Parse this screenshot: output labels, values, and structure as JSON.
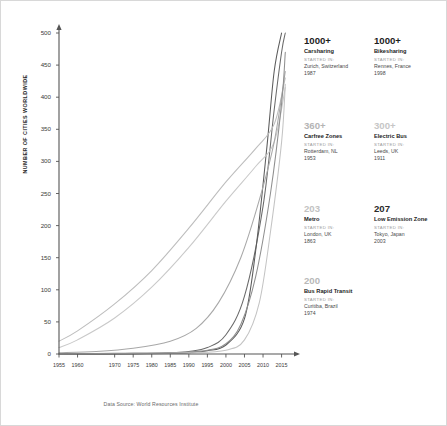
{
  "chart_data": {
    "type": "line",
    "title": "",
    "xlabel": "",
    "ylabel": "NUMBER OF CITIES WORLDWIDE",
    "xlim": [
      1955,
      2017
    ],
    "ylim": [
      0,
      500
    ],
    "grid": false,
    "legend_position": "right-panel",
    "x_tick_labels": [
      "1955",
      "1960",
      "1970",
      "1975",
      "1980",
      "1985",
      "1990",
      "1995",
      "2000",
      "2005",
      "2010",
      "2015"
    ],
    "x_ticks": [
      1955,
      1960,
      1970,
      1975,
      1980,
      1985,
      1990,
      1995,
      2000,
      2005,
      2010,
      2015
    ],
    "y_tick_labels": [
      "0",
      "50",
      "100",
      "150",
      "200",
      "250",
      "300",
      "350",
      "400",
      "450",
      "500"
    ],
    "y_ticks": [
      0,
      50,
      100,
      150,
      200,
      250,
      300,
      350,
      400,
      450,
      500
    ],
    "annotation": "Data Source: World Resources Institute",
    "series": [
      {
        "name": "Carsharing",
        "color": "#6a6a6a",
        "x": [
          1955,
          1965,
          1975,
          1985,
          1990,
          1995,
          2000,
          2005,
          2010,
          2013,
          2015,
          2016
        ],
        "values": [
          0,
          0,
          1,
          2,
          4,
          10,
          30,
          90,
          230,
          380,
          470,
          500
        ]
      },
      {
        "name": "Bikesharing",
        "color": "#5b5b5b",
        "x": [
          1955,
          1965,
          1975,
          1985,
          1990,
          1995,
          2000,
          2005,
          2008,
          2011,
          2013,
          2015
        ],
        "values": [
          0,
          0,
          0,
          1,
          2,
          5,
          14,
          55,
          160,
          320,
          440,
          500
        ]
      },
      {
        "name": "Carfree Zones",
        "color": "#bdbdbd",
        "x": [
          1955,
          1960,
          1970,
          1980,
          1990,
          2000,
          2008,
          2013,
          2016
        ],
        "values": [
          20,
          36,
          78,
          130,
          196,
          268,
          320,
          358,
          430
        ]
      },
      {
        "name": "Electric Bus",
        "color": "#c9c9c9",
        "x": [
          1955,
          1960,
          1970,
          1980,
          1990,
          2000,
          2008,
          2013,
          2016
        ],
        "values": [
          10,
          22,
          56,
          104,
          166,
          238,
          292,
          330,
          415
        ]
      },
      {
        "name": "Metro",
        "color": "#a8a8a8",
        "x": [
          1955,
          1965,
          1975,
          1985,
          1992,
          1998,
          2004,
          2009,
          2013,
          2016
        ],
        "values": [
          2,
          4,
          9,
          20,
          40,
          80,
          150,
          240,
          330,
          440
        ]
      },
      {
        "name": "Low Emission Zone",
        "color": "#8f8f8f",
        "x": [
          1955,
          1970,
          1985,
          1995,
          2000,
          2004,
          2008,
          2012,
          2015,
          2016
        ],
        "values": [
          0,
          1,
          2,
          6,
          16,
          46,
          120,
          250,
          390,
          470
        ]
      },
      {
        "name": "Bus Rapid Transit",
        "color": "#c4c4c4",
        "x": [
          1955,
          1975,
          1990,
          2000,
          2005,
          2009,
          2012,
          2015,
          2016
        ],
        "values": [
          0,
          1,
          2,
          6,
          22,
          80,
          190,
          330,
          420
        ]
      }
    ]
  },
  "axis": {
    "ylabel": "NUMBER OF CITIES WORLDWIDE",
    "source_note": "Data Source: World Resources Institute"
  },
  "stats": {
    "started_in_label": "STARTED IN:",
    "left_column": [
      {
        "value": "1000+",
        "value_color": "#1d1d1d",
        "name": "Carsharing",
        "started_in": "STARTED IN:",
        "place": "Zurich, Switzerland",
        "year": "1987"
      },
      {
        "value": "360+",
        "value_color": "#b4b4b4",
        "name": "Carfree Zones",
        "started_in": "STARTED IN:",
        "place": "Rotterdam, NL",
        "year": "1953"
      },
      {
        "value": "203",
        "value_color": "#c2c2c2",
        "name": "Metro",
        "started_in": "STARTED IN:",
        "place": "London, UK",
        "year": "1863"
      },
      {
        "value": "200",
        "value_color": "#b8b8b8",
        "name": "Bus Rapid Transit",
        "started_in": "STARTED IN:",
        "place": "Curitiba, Brazil",
        "year": "1974"
      }
    ],
    "right_column": [
      {
        "value": "1000+",
        "value_color": "#1d1d1d",
        "name": "Bikesharing",
        "started_in": "STARTED IN:",
        "place": "Rennes, France",
        "year": "1998"
      },
      {
        "value": "300+",
        "value_color": "#c6c6c6",
        "name": "Electric Bus",
        "started_in": "STARTED IN:",
        "place": "Leeds, UK",
        "year": "1911"
      },
      {
        "value": "207",
        "value_color": "#2b2b2b",
        "name": "Low Emission Zone",
        "started_in": "STARTED IN:",
        "place": "Tokyo, Japan",
        "year": "2003"
      }
    ]
  }
}
